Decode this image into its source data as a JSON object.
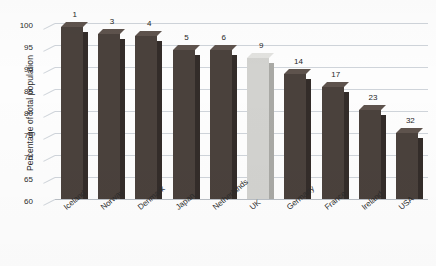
{
  "chart_data": {
    "type": "bar",
    "title": "",
    "subtitle": "",
    "xlabel": "",
    "ylabel": "Percentage of total population",
    "ylim": [
      60,
      100
    ],
    "ytick_interval": 5,
    "yticks": [
      "100",
      "95",
      "90",
      "85",
      "80",
      "75",
      "70",
      "65",
      "60"
    ],
    "grid": true,
    "legend": "none",
    "categories": [
      "Iceland",
      "Norway",
      "Denmark",
      "Japan",
      "Netherlands",
      "UK",
      "Germany",
      "France",
      "Ireland",
      "USA"
    ],
    "values": [
      99,
      97.5,
      97,
      93.8,
      93.8,
      92,
      88.3,
      85.4,
      80.2,
      75
    ],
    "point_labels": [
      "1",
      "3",
      "4",
      "5",
      "6",
      "9",
      "14",
      "17",
      "23",
      "32"
    ],
    "point_label_meaning": "world rank",
    "highlight_category": "UK",
    "colors": {
      "bar_front": "#4a413c",
      "bar_side": "#332c29",
      "bar_top": "#5e534d",
      "highlight_front": "#d2d2cf",
      "highlight_side": "#a9a9a5",
      "highlight_top": "#e2e2df",
      "gridline": "#cfd4da",
      "text": "#2b2b2b",
      "background": "#fdfdfd"
    }
  }
}
